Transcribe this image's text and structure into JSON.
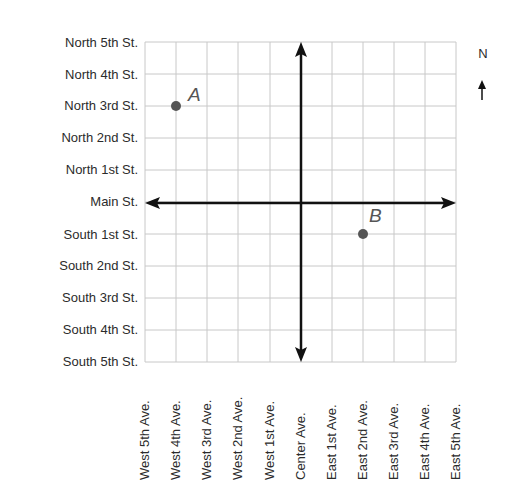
{
  "diagram": {
    "type": "street-grid-map",
    "streets": [
      "North 5th St.",
      "North 4th St.",
      "North 3rd St.",
      "North 2nd St.",
      "North 1st St.",
      "Main St.",
      "South 1st St.",
      "South 2nd St.",
      "South 3rd St.",
      "South 4th St.",
      "South 5th St."
    ],
    "avenues": [
      "West 5th Ave.",
      "West 4th Ave.",
      "West 3rd Ave.",
      "West 2nd Ave.",
      "West 1st Ave.",
      "Center Ave.",
      "East 1st Ave.",
      "East 2nd Ave.",
      "East 3rd Ave.",
      "East 4th Ave.",
      "East 5th Ave."
    ],
    "points": [
      {
        "label": "A",
        "avenue": "West 4th Ave.",
        "street": "North 3rd St.",
        "x": -4,
        "y": 3
      },
      {
        "label": "B",
        "avenue": "East 2nd Ave.",
        "street": "South 1st St.",
        "x": 2,
        "y": -1
      }
    ],
    "compass": {
      "label": "N",
      "direction": "up"
    },
    "colors": {
      "grid": "#c8c8c8",
      "axis": "#111111",
      "point": "#555555"
    }
  }
}
